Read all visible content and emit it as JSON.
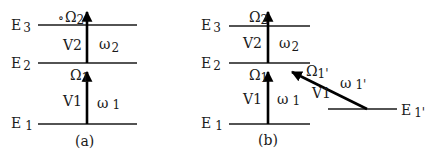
{
  "panels": [
    {
      "id": "a",
      "caption": "(a)",
      "levels": [
        {
          "label": "E",
          "sub": "3"
        },
        {
          "label": "E",
          "sub": "2"
        },
        {
          "label": "E",
          "sub": "1"
        }
      ],
      "transitions": [
        {
          "v": "V2",
          "omega": "ω",
          "omega_sub": "2",
          "rabi": "Ω",
          "rabi_sub": "2",
          "marker": "∘"
        },
        {
          "v": "V1",
          "omega": "ω",
          "omega_sub": "1",
          "rabi": "Ω",
          "rabi_sub": "1"
        }
      ]
    },
    {
      "id": "b",
      "caption": "(b)",
      "levels": [
        {
          "label": "E",
          "sub": "3"
        },
        {
          "label": "E",
          "sub": "2"
        },
        {
          "label": "E",
          "sub": "1"
        },
        {
          "label": "E",
          "sub": "1'"
        }
      ],
      "transitions": [
        {
          "v": "V2",
          "omega": "ω",
          "omega_sub": "2",
          "rabi": "Ω",
          "rabi_sub": "2"
        },
        {
          "v": "V1",
          "omega": "ω",
          "omega_sub": "1",
          "rabi": "Ω",
          "rabi_sub": "1"
        },
        {
          "v": "V1",
          "omega": "ω",
          "omega_sub": "1'",
          "rabi": "Ω",
          "rabi_sub": "1'"
        }
      ]
    }
  ],
  "colors": {
    "ink": "#000000",
    "background": "#ffffff"
  }
}
